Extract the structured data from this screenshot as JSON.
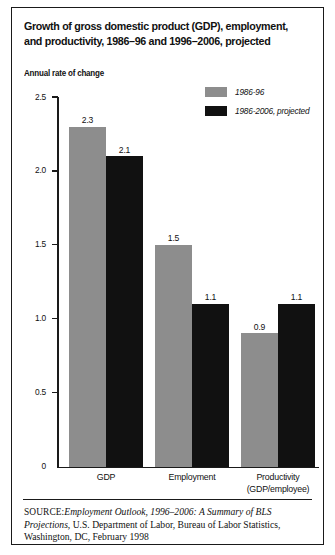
{
  "figure": {
    "title": "Growth of gross domestic product (GDP), employment, and productivity, 1986–96 and 1996–2006, projected",
    "axis_caption": "Annual rate of change",
    "source_label": "SOURCE:",
    "source_italic_1": "Employment Outlook, 1996–2006: A Summary of BLS Projections,",
    "source_rest": " U.S. Department of Labor, Bureau of Labor Statistics, Washington, DC, February 1998"
  },
  "legend": {
    "items": [
      {
        "label": "1986-96",
        "color": "#8d8d8d",
        "swatch_name": "legend-swatch-1986-96"
      },
      {
        "label": "1986-2006, projected",
        "color": "#111111",
        "swatch_name": "legend-swatch-1986-2006"
      }
    ]
  },
  "chart_data": {
    "type": "bar",
    "title": "Growth of gross domestic product (GDP), employment, and productivity, 1986–96 and 1996–2006, projected",
    "xlabel": "",
    "ylabel": "Annual rate of change",
    "ylim": [
      0,
      2.5
    ],
    "yticks": [
      "0",
      "0.5",
      "1.0",
      "1.5",
      "2.0",
      "2.5"
    ],
    "ytick_values": [
      0,
      0.5,
      1.0,
      1.5,
      2.0,
      2.5
    ],
    "grid": false,
    "legend_position": "top-right",
    "categories": [
      "GDP",
      "Employment",
      "Productivity (GDP/employee)"
    ],
    "category_lines": [
      [
        "GDP"
      ],
      [
        "Employment"
      ],
      [
        "Productivity",
        "(GDP/employee)"
      ]
    ],
    "series": [
      {
        "name": "1986-96",
        "color": "#8d8d8d",
        "values": [
          2.3,
          1.5,
          0.9
        ],
        "labels": [
          "2.3",
          "1.5",
          "0.9"
        ]
      },
      {
        "name": "1986-2006, projected",
        "color": "#111111",
        "values": [
          2.1,
          1.1,
          1.1
        ],
        "labels": [
          "2.1",
          "1.1",
          "1.1"
        ]
      }
    ]
  }
}
